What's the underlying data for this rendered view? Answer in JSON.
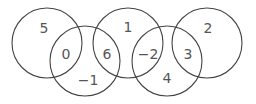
{
  "diagram": {
    "type": "overlapping-circles-chain",
    "stroke_color": "#444444",
    "text_color": "#555555",
    "circles": [
      {
        "id": "A",
        "cx": 47,
        "cy": 43,
        "r": 35
      },
      {
        "id": "B",
        "cx": 85,
        "cy": 61,
        "r": 35
      },
      {
        "id": "C",
        "cx": 128,
        "cy": 43,
        "r": 35
      },
      {
        "id": "D",
        "cx": 167,
        "cy": 61,
        "r": 35
      },
      {
        "id": "E",
        "cx": 207,
        "cy": 43,
        "r": 35
      }
    ],
    "labels": [
      {
        "region": "A only",
        "text": "5",
        "x": 44,
        "y": 28
      },
      {
        "region": "A∩B",
        "text": "0",
        "x": 66,
        "y": 54
      },
      {
        "region": "B only",
        "text": "−1",
        "x": 88,
        "y": 80
      },
      {
        "region": "B∩C",
        "text": "6",
        "x": 107,
        "y": 54
      },
      {
        "region": "C only",
        "text": "1",
        "x": 128,
        "y": 27
      },
      {
        "region": "C∩D",
        "text": "−2",
        "x": 148,
        "y": 54
      },
      {
        "region": "D only",
        "text": "4",
        "x": 167,
        "y": 78
      },
      {
        "region": "D∩E",
        "text": "3",
        "x": 188,
        "y": 54
      },
      {
        "region": "E only",
        "text": "2",
        "x": 208,
        "y": 28
      }
    ]
  }
}
